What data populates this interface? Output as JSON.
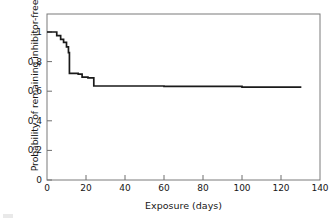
{
  "chart_data": {
    "type": "line",
    "subtype": "kaplan-meier-step",
    "title": "",
    "xlabel": "Exposure (days)",
    "ylabel": "Probability of remaining inhibitor-free",
    "xlim": [
      0,
      140
    ],
    "ylim": [
      0,
      1
    ],
    "xticks": [
      0,
      20,
      40,
      60,
      80,
      100,
      120,
      140
    ],
    "yticks": [
      0,
      0.2,
      0.4,
      0.6,
      0.8,
      1
    ],
    "xtick_labels": [
      "0",
      "20",
      "40",
      "60",
      "80",
      "100",
      "120",
      "140"
    ],
    "ytick_labels": [
      "0",
      "0.2",
      "0.4",
      "0.6",
      "0.8",
      "1"
    ],
    "grid": false,
    "legend": false,
    "line_color": "#1a1a1a",
    "axis_color": "#6e6e6e",
    "series": [
      {
        "name": "inhibitor-free survival",
        "step": "post",
        "x": [
          0,
          3,
          5,
          7,
          8.5,
          10,
          11,
          11.5,
          16,
          18,
          21,
          24,
          60,
          100,
          130
        ],
        "y": [
          1.0,
          1.0,
          0.975,
          0.95,
          0.93,
          0.9,
          0.86,
          0.72,
          0.715,
          0.695,
          0.69,
          0.635,
          0.632,
          0.628,
          0.622
        ]
      }
    ],
    "annotations": []
  }
}
